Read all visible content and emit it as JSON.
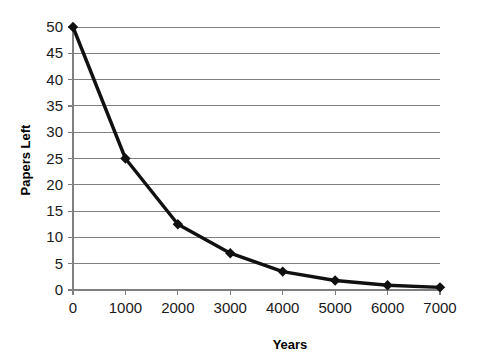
{
  "chart_data": {
    "type": "line",
    "title": "",
    "xlabel": "Years",
    "ylabel": "Papers Left",
    "x": [
      0,
      1000,
      2000,
      3000,
      4000,
      5000,
      6000,
      7000
    ],
    "values": [
      50,
      25,
      12.5,
      7,
      3.5,
      1.8,
      0.9,
      0.5
    ],
    "series": [
      {
        "name": "Papers Left",
        "values": [
          50,
          25,
          12.5,
          7,
          3.5,
          1.8,
          0.9,
          0.5
        ]
      }
    ],
    "xlim": [
      0,
      7000
    ],
    "ylim": [
      0,
      50
    ],
    "xticks": [
      0,
      1000,
      2000,
      3000,
      4000,
      5000,
      6000,
      7000
    ],
    "yticks": [
      0,
      5,
      10,
      15,
      20,
      25,
      30,
      35,
      40,
      45,
      50
    ],
    "xtick_labels": [
      "0",
      "1000",
      "2000",
      "3000",
      "4000",
      "5000",
      "6000",
      "7000"
    ],
    "ytick_labels": [
      "0",
      "5",
      "10",
      "15",
      "20",
      "25",
      "30",
      "35",
      "40",
      "45",
      "50"
    ],
    "grid": "horizontal",
    "legend": "none",
    "marker": "diamond",
    "line_color": "#101010",
    "grid_color": "#7f7f7f",
    "background_color": "#ffffff"
  }
}
